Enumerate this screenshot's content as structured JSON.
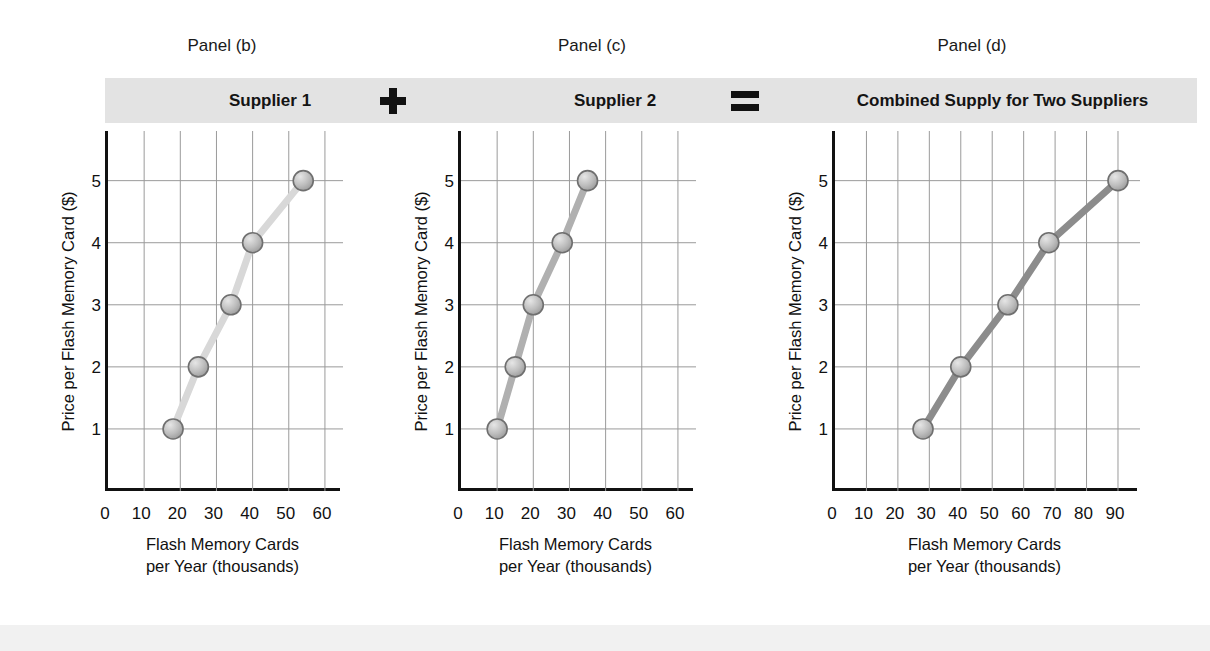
{
  "figure": {
    "operator_plus": "+",
    "operator_equals": "="
  },
  "panels": [
    {
      "caption": "Panel (b)",
      "title": "Supplier 1",
      "ylabel": "Price per Flash Memory Card ($)",
      "xcaption_line1": "Flash Memory Cards",
      "xcaption_line2": "per Year (thousands)",
      "xticks": [
        "0",
        "10",
        "20",
        "30",
        "40",
        "50",
        "60"
      ],
      "yticks": [
        "1",
        "2",
        "3",
        "4",
        "5"
      ]
    },
    {
      "caption": "Panel (c)",
      "title": "Supplier 2",
      "ylabel": "Price per Flash Memory Card ($)",
      "xcaption_line1": "Flash Memory Cards",
      "xcaption_line2": "per Year (thousands)",
      "xticks": [
        "0",
        "10",
        "20",
        "30",
        "40",
        "50",
        "60"
      ],
      "yticks": [
        "1",
        "2",
        "3",
        "4",
        "5"
      ]
    },
    {
      "caption": "Panel (d)",
      "title": "Combined Supply for Two Suppliers",
      "ylabel": "Price per Flash Memory Card ($)",
      "xcaption_line1": "Flash Memory Cards",
      "xcaption_line2": "per Year (thousands)",
      "xticks": [
        "0",
        "10",
        "20",
        "30",
        "40",
        "50",
        "60",
        "70",
        "80",
        "90"
      ],
      "yticks": [
        "1",
        "2",
        "3",
        "4",
        "5"
      ]
    }
  ],
  "chart_data": [
    {
      "type": "line",
      "title": "Supplier 1",
      "panel": "Panel (b)",
      "xlabel": "Flash Memory Cards per Year (thousands)",
      "ylabel": "Price per Flash Memory Card ($)",
      "xlim": [
        0,
        65
      ],
      "ylim": [
        0,
        5.8
      ],
      "xticks": [
        0,
        10,
        20,
        30,
        40,
        50,
        60
      ],
      "yticks": [
        1,
        2,
        3,
        4,
        5
      ],
      "grid": true,
      "legend": "none",
      "x": [
        18,
        25,
        34,
        40,
        54
      ],
      "y": [
        1,
        2,
        3,
        4,
        5
      ],
      "line_color": "#d8d8d8",
      "marker_color": "#b9b9b9"
    },
    {
      "type": "line",
      "title": "Supplier 2",
      "panel": "Panel (c)",
      "xlabel": "Flash Memory Cards per Year (thousands)",
      "ylabel": "Price per Flash Memory Card ($)",
      "xlim": [
        0,
        65
      ],
      "ylim": [
        0,
        5.8
      ],
      "xticks": [
        0,
        10,
        20,
        30,
        40,
        50,
        60
      ],
      "yticks": [
        1,
        2,
        3,
        4,
        5
      ],
      "grid": true,
      "legend": "none",
      "x": [
        10,
        15,
        20,
        28,
        35
      ],
      "y": [
        1,
        2,
        3,
        4,
        5
      ],
      "line_color": "#b0b0b0",
      "marker_color": "#b9b9b9"
    },
    {
      "type": "line",
      "title": "Combined Supply for Two Suppliers",
      "panel": "Panel (d)",
      "xlabel": "Flash Memory Cards per Year (thousands)",
      "ylabel": "Price per Flash Memory Card ($)",
      "xlim": [
        0,
        97
      ],
      "ylim": [
        0,
        5.8
      ],
      "xticks": [
        0,
        10,
        20,
        30,
        40,
        50,
        60,
        70,
        80,
        90
      ],
      "yticks": [
        1,
        2,
        3,
        4,
        5
      ],
      "grid": true,
      "legend": "none",
      "x": [
        28,
        40,
        55,
        68,
        90
      ],
      "y": [
        1,
        2,
        3,
        4,
        5
      ],
      "line_color": "#8c8c8c",
      "marker_color": "#b9b9b9"
    }
  ]
}
